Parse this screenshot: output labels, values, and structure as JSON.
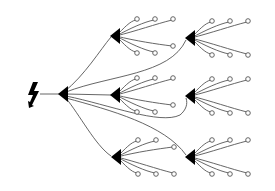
{
  "diagram": {
    "type": "tree",
    "colors": {
      "background": "#ffffff",
      "wire": "#555555",
      "node": "#000000",
      "terminal_fill": "#ffffff"
    },
    "source": {
      "id": "source",
      "icon": "lightning-bolt-icon",
      "x": 33,
      "y": 93
    },
    "root": {
      "id": "root",
      "x": 63,
      "y": 94
    },
    "nodes": [
      {
        "id": "n1",
        "x": 116,
        "y": 36
      },
      {
        "id": "n2",
        "x": 191,
        "y": 38
      },
      {
        "id": "n3",
        "x": 116,
        "y": 95
      },
      {
        "id": "n4",
        "x": 191,
        "y": 96
      },
      {
        "id": "n5",
        "x": 117,
        "y": 157
      },
      {
        "id": "n6",
        "x": 191,
        "y": 157
      }
    ],
    "edges": [
      {
        "from": "source",
        "to": "root"
      },
      {
        "from": "root",
        "to": "n1"
      },
      {
        "from": "root",
        "to": "n2"
      },
      {
        "from": "root",
        "to": "n3"
      },
      {
        "from": "root",
        "to": "n4"
      },
      {
        "from": "root",
        "to": "n5"
      },
      {
        "from": "root",
        "to": "n6"
      }
    ],
    "terminals_per_node": 6,
    "terminal_count": 36
  }
}
